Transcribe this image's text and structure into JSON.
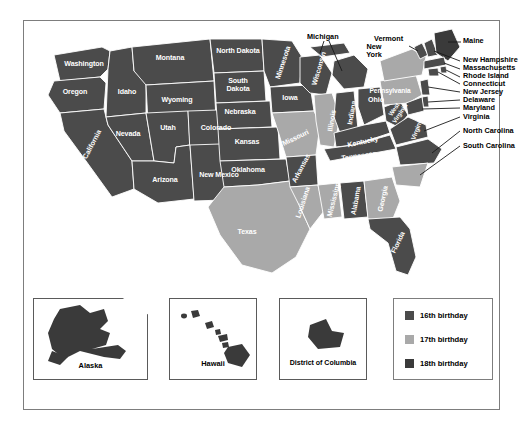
{
  "figure": {
    "kind": "choropleth-map",
    "region": "United States",
    "background": "#ffffff",
    "border_color": "#7d7d7d"
  },
  "colors": {
    "cat16": "#4b4b4b",
    "cat17": "#a9a9a9",
    "cat18": "#3a3a3a",
    "water": "#ffffff",
    "state_border": "#ffffff",
    "outline": "#555555",
    "label_on_dark": "#ffffff",
    "label_outside": "#000000",
    "leader_line": "#1a1a1a"
  },
  "legend": {
    "items": [
      {
        "label": "16th birthday",
        "color_key": "cat16",
        "swatch": "#4b4b4b"
      },
      {
        "label": "17th birthday",
        "color_key": "cat17",
        "swatch": "#a9a9a9"
      },
      {
        "label": "18th birthday",
        "color_key": "cat18",
        "swatch": "#3a3a3a"
      }
    ]
  },
  "states_inside": [
    {
      "name": "Washington",
      "cat": "cat16"
    },
    {
      "name": "Oregon",
      "cat": "cat16"
    },
    {
      "name": "California",
      "cat": "cat16"
    },
    {
      "name": "Idaho",
      "cat": "cat16"
    },
    {
      "name": "Montana",
      "cat": "cat16"
    },
    {
      "name": "Wyoming",
      "cat": "cat16"
    },
    {
      "name": "Nevada",
      "cat": "cat16"
    },
    {
      "name": "Utah",
      "cat": "cat16"
    },
    {
      "name": "Colorado",
      "cat": "cat16"
    },
    {
      "name": "Arizona",
      "cat": "cat16"
    },
    {
      "name": "New Mexico",
      "cat": "cat16"
    },
    {
      "name": "North Dakota",
      "cat": "cat16"
    },
    {
      "name": "South Dakota",
      "cat": "cat16"
    },
    {
      "name": "Nebraska",
      "cat": "cat16"
    },
    {
      "name": "Kansas",
      "cat": "cat16"
    },
    {
      "name": "Oklahoma",
      "cat": "cat16"
    },
    {
      "name": "Texas",
      "cat": "cat17"
    },
    {
      "name": "Minnesota",
      "cat": "cat16"
    },
    {
      "name": "Iowa",
      "cat": "cat16"
    },
    {
      "name": "Missouri",
      "cat": "cat17"
    },
    {
      "name": "Arkansas",
      "cat": "cat16"
    },
    {
      "name": "Louisiana",
      "cat": "cat17"
    },
    {
      "name": "Wisconsin",
      "cat": "cat16"
    },
    {
      "name": "Illinois",
      "cat": "cat17"
    },
    {
      "name": "Mississippi",
      "cat": "cat17"
    },
    {
      "name": "Indiana",
      "cat": "cat16"
    },
    {
      "name": "Kentucky",
      "cat": "cat16"
    },
    {
      "name": "Tennessee",
      "cat": "cat16"
    },
    {
      "name": "Alabama",
      "cat": "cat16"
    },
    {
      "name": "Ohio",
      "cat": "cat16"
    },
    {
      "name": "West Virginia",
      "cat": "cat16"
    },
    {
      "name": "Virginia",
      "cat": "cat16"
    },
    {
      "name": "Georgia",
      "cat": "cat17"
    },
    {
      "name": "Florida",
      "cat": "cat16"
    },
    {
      "name": "Pennsylvania",
      "cat": "cat17"
    }
  ],
  "callout_labels": [
    {
      "name": "Michigan"
    },
    {
      "name": "New York"
    },
    {
      "name": "Vermont"
    },
    {
      "name": "Maine"
    },
    {
      "name": "New Hampshire"
    },
    {
      "name": "Massachusetts"
    },
    {
      "name": "Rhode Island"
    },
    {
      "name": "Connecticut"
    },
    {
      "name": "New Jersey"
    },
    {
      "name": "Delaware"
    },
    {
      "name": "Maryland"
    },
    {
      "name": "Virginia"
    },
    {
      "name": "North Carolina"
    },
    {
      "name": "South Carolina"
    },
    {
      "name": "Pennsylvania"
    }
  ],
  "insets": [
    {
      "name": "Alaska",
      "cat": "cat18"
    },
    {
      "name": "Hawaii",
      "cat": "cat18"
    },
    {
      "name": "District of Columbia",
      "cat": "cat18"
    }
  ]
}
